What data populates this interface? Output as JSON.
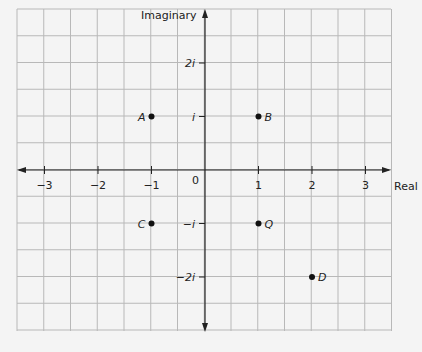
{
  "chart_data": {
    "type": "scatter",
    "title": "",
    "xlabel": "Real",
    "ylabel": "Imaginary",
    "xlim": [
      -3.5,
      3.5
    ],
    "ylim": [
      -3,
      3
    ],
    "grid": true,
    "x_ticks": [
      {
        "value": -3,
        "label": "−3"
      },
      {
        "value": -2,
        "label": "−2"
      },
      {
        "value": -1,
        "label": "−1"
      },
      {
        "value": 1,
        "label": "1"
      },
      {
        "value": 2,
        "label": "2"
      },
      {
        "value": 3,
        "label": "3"
      }
    ],
    "y_ticks": [
      {
        "value": 2,
        "label": "2i"
      },
      {
        "value": 1,
        "label": "i"
      },
      {
        "value": -1,
        "label": "−i"
      },
      {
        "value": -2,
        "label": "−2i"
      }
    ],
    "origin_label": "0",
    "points": [
      {
        "name": "A",
        "re": -1,
        "im": 1,
        "label_side": "left"
      },
      {
        "name": "B",
        "re": 1,
        "im": 1,
        "label_side": "right"
      },
      {
        "name": "C",
        "re": -1,
        "im": -1,
        "label_side": "left"
      },
      {
        "name": "Q",
        "re": 1,
        "im": -1,
        "label_side": "right"
      },
      {
        "name": "D",
        "re": 2,
        "im": -2,
        "label_side": "right"
      }
    ]
  },
  "colors": {
    "grid": "#b8b8b8",
    "axis": "#222222",
    "point": "#111111",
    "background": "#f4f4f4"
  }
}
